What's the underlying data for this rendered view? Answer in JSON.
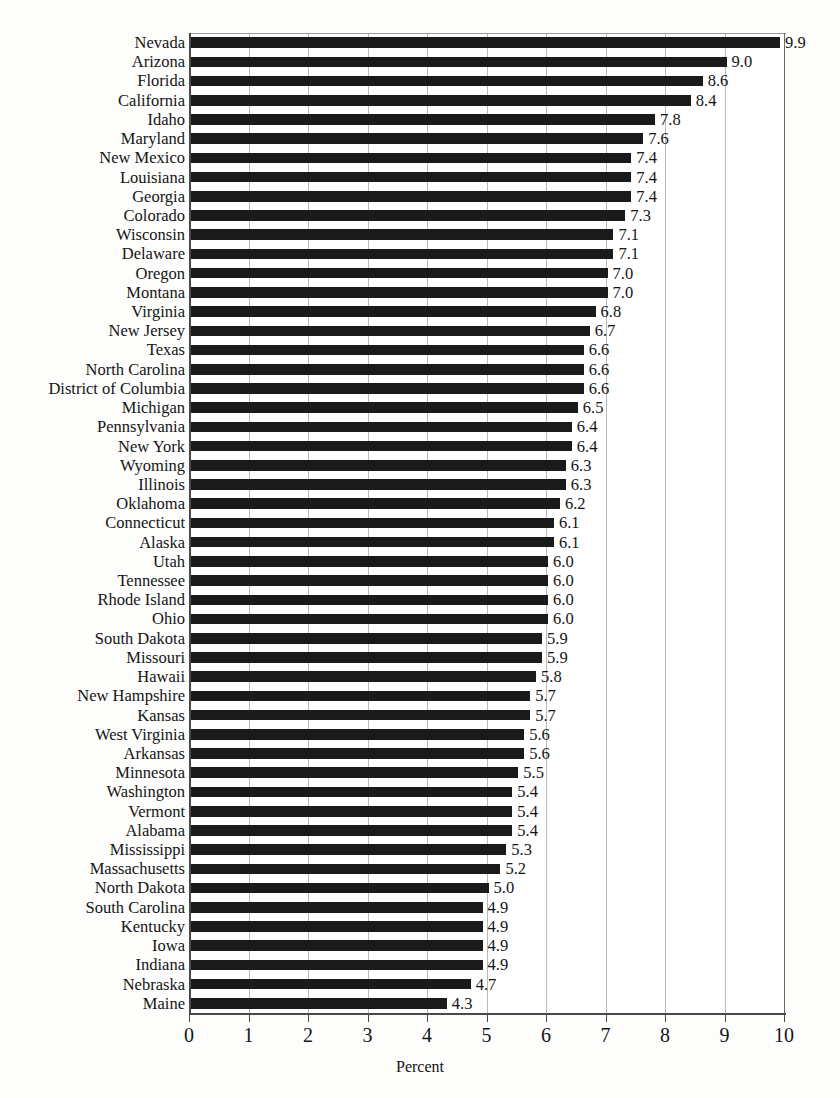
{
  "chart_data": {
    "type": "bar",
    "orientation": "horizontal",
    "title": "",
    "subtitle": "",
    "xlabel": "Percent",
    "ylabel": "",
    "xlim": [
      0,
      10
    ],
    "xticks": [
      0,
      1,
      2,
      3,
      4,
      5,
      6,
      7,
      8,
      9,
      10
    ],
    "xtick_labels": [
      "0",
      "1",
      "2",
      "3",
      "4",
      "5",
      "6",
      "7",
      "8",
      "9",
      "10"
    ],
    "grid": true,
    "grid_axis": "x",
    "legend": null,
    "bar_color": "#1a1a1a",
    "background_color": "#ffffff",
    "gridline_color": "#b9b9b9",
    "axis_color": "#4a4a4a",
    "data_labels": true,
    "data_label_format": "one-decimal",
    "categories": [
      "Nevada",
      "Arizona",
      "Florida",
      "California",
      "Idaho",
      "Maryland",
      "New Mexico",
      "Louisiana",
      "Georgia",
      "Colorado",
      "Wisconsin",
      "Delaware",
      "Oregon",
      "Montana",
      "Virginia",
      "New Jersey",
      "Texas",
      "North Carolina",
      "District of Columbia",
      "Michigan",
      "Pennsylvania",
      "New York",
      "Wyoming",
      "Illinois",
      "Oklahoma",
      "Connecticut",
      "Alaska",
      "Utah",
      "Tennessee",
      "Rhode Island",
      "Ohio",
      "South Dakota",
      "Missouri",
      "Hawaii",
      "New Hampshire",
      "Kansas",
      "West Virginia",
      "Arkansas",
      "Minnesota",
      "Washington",
      "Vermont",
      "Alabama",
      "Mississippi",
      "Massachusetts",
      "North Dakota",
      "South Carolina",
      "Kentucky",
      "Iowa",
      "Indiana",
      "Nebraska",
      "Maine"
    ],
    "values": [
      9.9,
      9.0,
      8.6,
      8.4,
      7.8,
      7.6,
      7.4,
      7.4,
      7.4,
      7.3,
      7.1,
      7.1,
      7.0,
      7.0,
      6.8,
      6.7,
      6.6,
      6.6,
      6.6,
      6.5,
      6.4,
      6.4,
      6.3,
      6.3,
      6.2,
      6.1,
      6.1,
      6.0,
      6.0,
      6.0,
      6.0,
      5.9,
      5.9,
      5.8,
      5.7,
      5.7,
      5.6,
      5.6,
      5.5,
      5.4,
      5.4,
      5.4,
      5.3,
      5.2,
      5.0,
      4.9,
      4.9,
      4.9,
      4.9,
      4.7,
      4.3
    ],
    "value_labels": [
      "9.9",
      "9.0",
      "8.6",
      "8.4",
      "7.8",
      "7.6",
      "7.4",
      "7.4",
      "7.4",
      "7.3",
      "7.1",
      "7.1",
      "7.0",
      "7.0",
      "6.8",
      "6.7",
      "6.6",
      "6.6",
      "6.6",
      "6.5",
      "6.4",
      "6.4",
      "6.3",
      "6.3",
      "6.2",
      "6.1",
      "6.1",
      "6.0",
      "6.0",
      "6.0",
      "6.0",
      "5.9",
      "5.9",
      "5.8",
      "5.7",
      "5.7",
      "5.6",
      "5.6",
      "5.5",
      "5.4",
      "5.4",
      "5.4",
      "5.3",
      "5.2",
      "5.0",
      "4.9",
      "4.9",
      "4.9",
      "4.9",
      "4.7",
      "4.3"
    ]
  }
}
